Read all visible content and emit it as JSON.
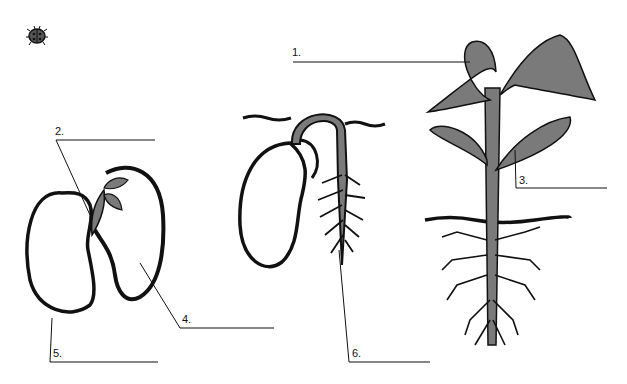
{
  "diagram": {
    "colors": {
      "ink": "#111111",
      "fill": "#7a7a7a",
      "background": "#ffffff"
    },
    "labels": [
      {
        "id": "1",
        "text": "1."
      },
      {
        "id": "2",
        "text": "2."
      },
      {
        "id": "3",
        "text": "3."
      },
      {
        "id": "4",
        "text": "4."
      },
      {
        "id": "5",
        "text": "5."
      },
      {
        "id": "6",
        "text": "6."
      }
    ],
    "icons": [
      "ladybug-icon"
    ],
    "stages": [
      "open-seed",
      "germinating-seed",
      "seedling"
    ]
  }
}
